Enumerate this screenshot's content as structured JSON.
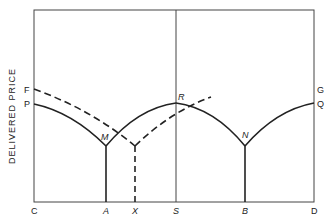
{
  "diagram": {
    "y_axis_label": "DELIVERED PRICE",
    "left_labels": {
      "F": "F",
      "P": "P"
    },
    "right_labels": {
      "G": "G",
      "Q": "Q"
    },
    "point_labels": {
      "M": "M",
      "R": "R",
      "N": "N"
    },
    "x_axis_labels": [
      "C",
      "A",
      "X",
      "S",
      "B",
      "D"
    ],
    "colors": {
      "line": "#222222",
      "background": "#ffffff"
    }
  }
}
